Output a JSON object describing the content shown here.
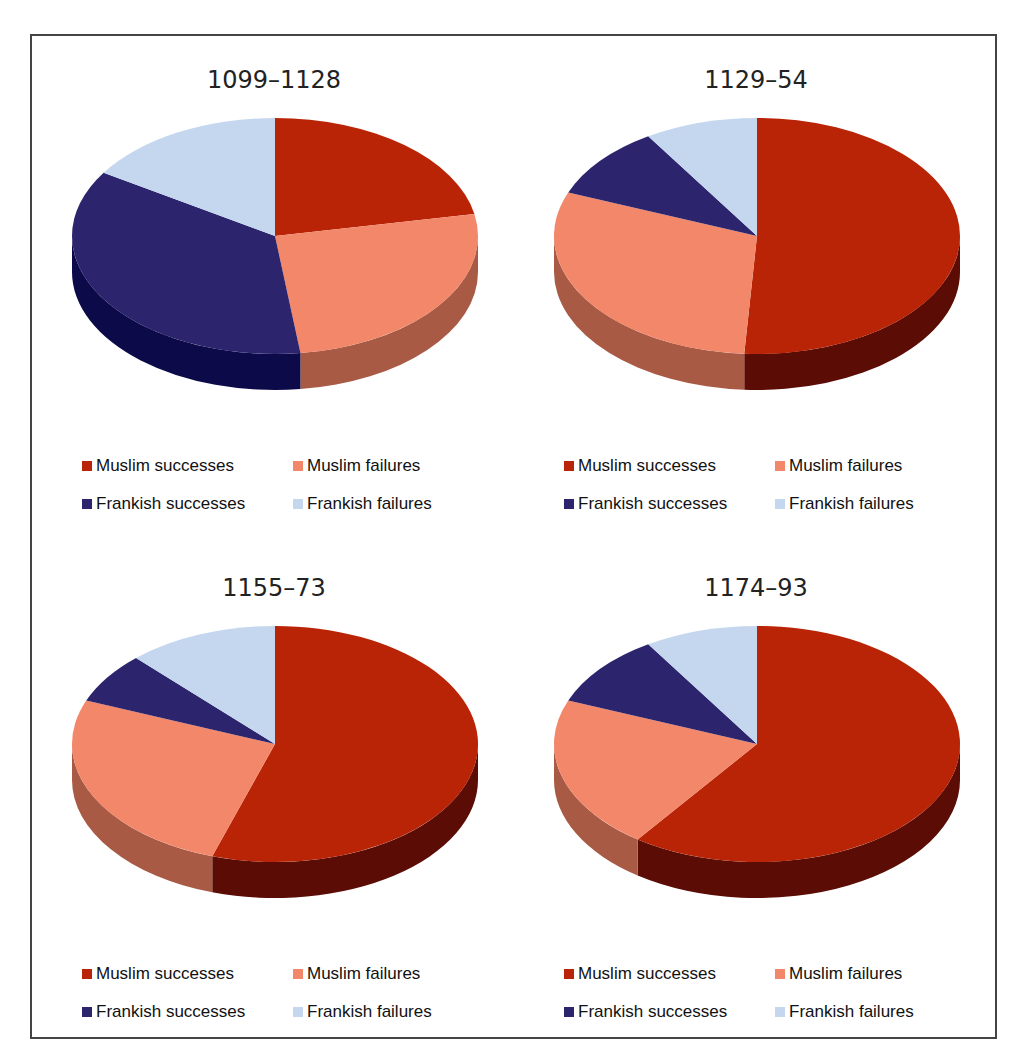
{
  "series_labels": [
    "Muslim successes",
    "Muslim failures",
    "Frankish successes",
    "Frankish failures"
  ],
  "colors": {
    "muslim_successes": "#b82405",
    "muslim_failures": "#f3876a",
    "frankish_successes": "#2c256e",
    "frankish_failures": "#c4d7ef"
  },
  "side_colors": {
    "muslim_successes": "#5a0c05",
    "muslim_failures": "#a85a45",
    "frankish_successes": "#0d0a4a",
    "frankish_failures": "#8fa3bd"
  },
  "panels": [
    {
      "title": "1099–1128"
    },
    {
      "title": "1129–54"
    },
    {
      "title": "1155–73"
    },
    {
      "title": "1174–93"
    }
  ],
  "legend": {
    "muslim_successes": "Muslim successes",
    "muslim_failures": "Muslim failures",
    "frankish_successes": "Frankish successes",
    "frankish_failures": "Frankish failures"
  },
  "chart_data": [
    {
      "type": "pie",
      "title": "1099–1128",
      "categories": [
        "Muslim successes",
        "Muslim failures",
        "Frankish successes",
        "Frankish failures"
      ],
      "values": [
        22,
        26,
        36,
        16
      ],
      "legend_position": "bottom",
      "style": "3d"
    },
    {
      "type": "pie",
      "title": "1129–54",
      "categories": [
        "Muslim successes",
        "Muslim failures",
        "Frankish successes",
        "Frankish failures"
      ],
      "values": [
        51,
        30,
        10,
        9
      ],
      "legend_position": "bottom",
      "style": "3d"
    },
    {
      "type": "pie",
      "title": "1155–73",
      "categories": [
        "Muslim successes",
        "Muslim failures",
        "Frankish successes",
        "Frankish failures"
      ],
      "values": [
        55,
        26,
        7,
        12
      ],
      "legend_position": "bottom",
      "style": "3d"
    },
    {
      "type": "pie",
      "title": "1174–93",
      "categories": [
        "Muslim successes",
        "Muslim failures",
        "Frankish successes",
        "Frankish failures"
      ],
      "values": [
        60,
        21,
        10,
        9
      ],
      "legend_position": "bottom",
      "style": "3d"
    }
  ]
}
